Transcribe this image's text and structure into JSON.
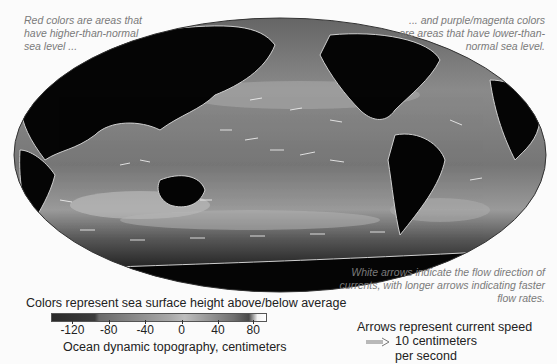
{
  "annotations": {
    "top_left": "Red colors are areas that have higher-than-normal sea level ...",
    "top_right": "... and purple/magenta colors are areas  that have lower-than-normal sea level.",
    "bottom_right": "White arrows indicate the flow direction of currents, with longer arrows indicating faster flow rates."
  },
  "map": {
    "projection": "Mollweide (world, Pacific-centered)",
    "land_color": "#050505",
    "ocean_base_color": "#6e6e6e",
    "arrow_color": "#f2f2f2"
  },
  "legend": {
    "title": "Colors represent sea surface height above/below average",
    "axis_label": "Ocean dynamic topography, centimeters",
    "ticks": [
      {
        "label": "-120",
        "pos": 0.1
      },
      {
        "label": "-80",
        "pos": 0.27
      },
      {
        "label": "-40",
        "pos": 0.44
      },
      {
        "label": "0",
        "pos": 0.61
      },
      {
        "label": "40",
        "pos": 0.78
      },
      {
        "label": "80",
        "pos": 0.945
      }
    ],
    "range": [
      -140,
      100
    ]
  },
  "arrow_legend": {
    "title": "Arrows represent current speed",
    "scale_label_line1": "10 centimeters",
    "scale_label_line2": "per second"
  }
}
